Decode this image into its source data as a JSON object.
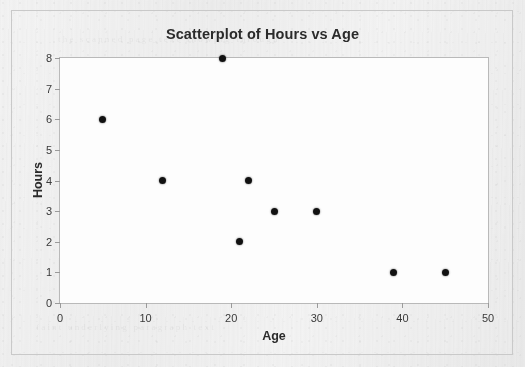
{
  "chart_data": {
    "type": "scatter",
    "title": "Scatterplot of Hours vs Age",
    "xlabel": "Age",
    "ylabel": "Hours",
    "xlim": [
      0,
      50
    ],
    "ylim": [
      0,
      8
    ],
    "xticks": [
      "0",
      "10",
      "20",
      "30",
      "40",
      "50"
    ],
    "yticks": [
      "0",
      "1",
      "2",
      "3",
      "4",
      "5",
      "6",
      "7",
      "8"
    ],
    "grid": false,
    "legend": null,
    "marker": {
      "shape": "filled-circle",
      "color": "#111111",
      "size_px": 7
    },
    "series": [
      {
        "name": "Hours vs Age",
        "points": [
          {
            "x": 5,
            "y": 6
          },
          {
            "x": 12,
            "y": 4
          },
          {
            "x": 19,
            "y": 8
          },
          {
            "x": 21,
            "y": 2
          },
          {
            "x": 22,
            "y": 4
          },
          {
            "x": 25,
            "y": 3
          },
          {
            "x": 30,
            "y": 3
          },
          {
            "x": 39,
            "y": 1
          },
          {
            "x": 45,
            "y": 1
          }
        ]
      }
    ]
  },
  "figure": {
    "background_color": "#eeeeee",
    "plot_background_color": "#fdfdfd",
    "border_color": "#c9c9c9",
    "axis_color": "#b9b9b9",
    "text_color": "#2b2b2b"
  },
  "page_ghost": {
    "line_top": "the scanned page text showing through",
    "line_bottom": "faint underlying paragraph text"
  }
}
